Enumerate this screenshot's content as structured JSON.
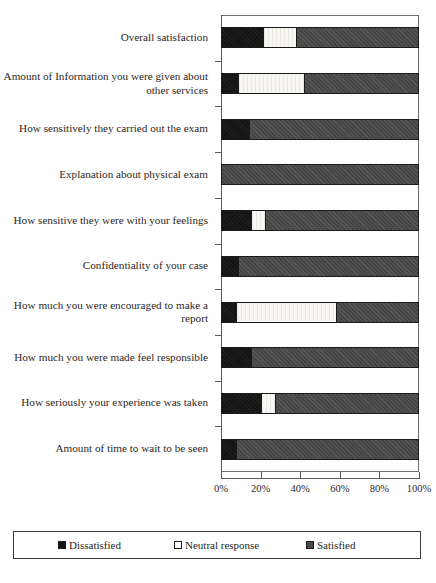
{
  "chart_data": {
    "type": "bar",
    "orientation": "horizontal",
    "stacked": true,
    "title": "",
    "subtitle": "",
    "xlabel": "",
    "ylabel": "",
    "xlim": [
      0,
      100
    ],
    "xticks": [
      0,
      20,
      40,
      60,
      80,
      100
    ],
    "xticklabels": [
      "0%",
      "20%",
      "40%",
      "60%",
      "80%",
      "100%"
    ],
    "grid": false,
    "legend_position": "bottom",
    "categories": [
      "Overall satisfaction",
      "Amount of Information you were given about other services",
      "How sensitively they carried out the exam",
      "Explanation about physical exam",
      "How sensitive they were with your feelings",
      "Confidentiality of your case",
      "How much you were encouraged to make a report",
      "How much you were made feel responsible",
      "How seriously your experience was taken",
      "Amount of time to wait to be seen"
    ],
    "series": [
      {
        "name": "Dissatisfied",
        "color": "#141414",
        "values": [
          21,
          8,
          14,
          0,
          15,
          8,
          7,
          15,
          20,
          7
        ]
      },
      {
        "name": "Neutral response",
        "color": "#ffffff",
        "values": [
          17,
          34,
          0,
          0,
          7,
          0,
          51,
          0,
          7,
          0
        ]
      },
      {
        "name": "Satisfied",
        "color": "#4a4a4a",
        "values": [
          62,
          58,
          86,
          100,
          78,
          92,
          42,
          85,
          73,
          93
        ]
      }
    ]
  },
  "legend": {
    "entries": [
      {
        "label": "Dissatisfied",
        "swatch": "legend-swatch-dissatisfied"
      },
      {
        "label": "Neutral response",
        "swatch": "legend-swatch-neutral"
      },
      {
        "label": "Satisfied",
        "swatch": "legend-swatch-satisfied"
      }
    ]
  }
}
